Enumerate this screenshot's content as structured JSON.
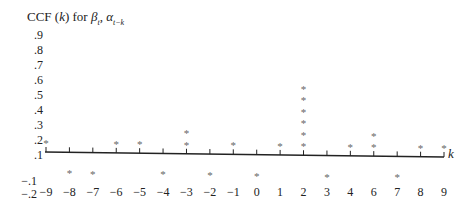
{
  "chart_data": {
    "type": "scatter",
    "style": "asterisk-stack",
    "title_parts": {
      "prefix": "CCF (",
      "k": "k",
      "mid": ") for ",
      "beta": "β",
      "beta_sub": "t",
      "comma": ", ",
      "alpha": "α",
      "alpha_sub": "t−k"
    },
    "xlabel": "k",
    "ylabel": "CCF (k)",
    "ylim": [
      -0.2,
      0.9
    ],
    "grid": false,
    "legend": null,
    "y_ticks": [
      ".9",
      ".8",
      ".7",
      ".6",
      ".5",
      ".4",
      ".3",
      ".2",
      ".1",
      "−.1",
      "−.2"
    ],
    "x_tick_labels": [
      "−9",
      "−8",
      "−7",
      "−6",
      "−5",
      "−4",
      "−3",
      "−2",
      "−1",
      "0",
      "1",
      "2",
      "3",
      "4",
      "6",
      "7",
      "8",
      "9"
    ],
    "x": [
      -9,
      -8,
      -7,
      -6,
      -5,
      -4,
      -3,
      -2,
      -1,
      0,
      1,
      2,
      3,
      4,
      5,
      7,
      8,
      9
    ],
    "values": [
      0.1,
      -0.1,
      -0.1,
      0.1,
      0.1,
      -0.1,
      0.2,
      -0.1,
      0.1,
      -0.1,
      0.1,
      0.6,
      -0.1,
      0.1,
      0.2,
      -0.1,
      0.1,
      0.1
    ],
    "star_counts": [
      1,
      -1,
      -1,
      1,
      1,
      -1,
      2,
      -1,
      1,
      -1,
      1,
      6,
      -1,
      1,
      2,
      -1,
      1,
      1
    ],
    "annotations": [
      "Each asterisk represents 0.1",
      "Tick label after 4 reads '6' (label sequence skips 5)"
    ]
  }
}
